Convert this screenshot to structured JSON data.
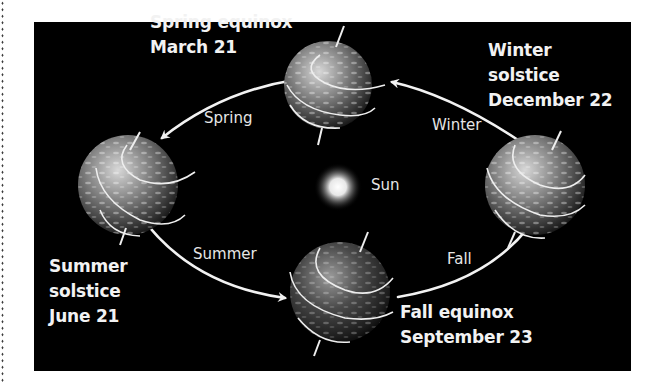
{
  "diagram": {
    "background_color": "#000000",
    "text_color": "#f2f2f2",
    "center": {
      "label": "Sun",
      "icon": "sun-icon"
    },
    "positions": [
      {
        "id": "spring-equinox",
        "lines": [
          "Spring equinox",
          "March 21"
        ],
        "icon": "earth-globe-icon"
      },
      {
        "id": "summer-solstice",
        "lines": [
          "Summer",
          "solstice",
          "June 21"
        ],
        "icon": "earth-globe-icon"
      },
      {
        "id": "fall-equinox",
        "lines": [
          "Fall equinox",
          "September 23"
        ],
        "icon": "earth-globe-icon"
      },
      {
        "id": "winter-solstice",
        "lines": [
          "Winter",
          "solstice",
          "December 22"
        ],
        "icon": "earth-globe-icon"
      }
    ],
    "seasons": [
      {
        "label": "Spring",
        "from": "spring-equinox",
        "to": "summer-solstice"
      },
      {
        "label": "Summer",
        "from": "summer-solstice",
        "to": "fall-equinox"
      },
      {
        "label": "Fall",
        "from": "fall-equinox",
        "to": "winter-solstice"
      },
      {
        "label": "Winter",
        "from": "winter-solstice",
        "to": "spring-equinox"
      }
    ]
  }
}
